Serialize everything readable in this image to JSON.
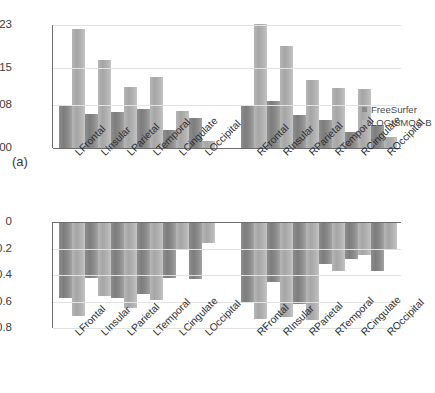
{
  "figure": {
    "panel_a_tag": "(a)",
    "panel_b_tag": "(b)"
  },
  "legend": {
    "freesurfer": "FreeSurfer",
    "logismos": "LOGISMOS-B"
  },
  "colors": {
    "freesurfer": "#8a8a8a",
    "logismos": "#b4b4b4",
    "grid": "#e2e2e2",
    "axis": "#6e6e6e",
    "background": "#ffffff"
  },
  "chart_data": [
    {
      "type": "bar",
      "panel": "(a)",
      "title": "",
      "xlabel": "",
      "ylabel": "",
      "ylim": [
        0.0,
        0.023
      ],
      "yticks": [
        0.0,
        0.008,
        0.015,
        0.023
      ],
      "ytick_labels": [
        "0.000",
        "0.008",
        "0.015",
        "0.023"
      ],
      "grid": true,
      "legend_position": "right",
      "group_gap_after_index": 5,
      "categories": [
        "LFrontal",
        "LInsular",
        "LParietal",
        "LTemporal",
        "LCingulate",
        "LOccipital",
        "RFrontal",
        "RInsular",
        "RParietal",
        "RTemporal",
        "RCingulate",
        "ROccipital"
      ],
      "series": [
        {
          "name": "FreeSurfer",
          "values": [
            0.0079,
            0.0064,
            0.0068,
            0.0072,
            0.0034,
            0.0056,
            0.0081,
            0.0088,
            0.0062,
            0.0053,
            0.0029,
            0.0043
          ]
        },
        {
          "name": "LOGISMOS-B",
          "values": [
            0.0222,
            0.0164,
            0.0115,
            0.0132,
            0.007,
            0.0014,
            0.0232,
            0.019,
            0.0128,
            0.0112,
            0.011,
            0.0021
          ]
        }
      ]
    },
    {
      "type": "bar",
      "panel": "(b)",
      "title": "",
      "xlabel": "",
      "ylabel": "",
      "ylim": [
        -0.8,
        0.0
      ],
      "yticks": [
        0.0,
        -0.2,
        -0.4,
        -0.6,
        -0.8
      ],
      "ytick_labels": [
        "0",
        "−0.2",
        "−0.4",
        "−0.6",
        "−0.8"
      ],
      "grid": true,
      "legend_position": "right",
      "group_gap_after_index": 5,
      "categories": [
        "LFrontal",
        "LInsular",
        "LParietal",
        "LTemporal",
        "LCingulate",
        "LOccipital",
        "RFrontal",
        "RInsular",
        "RParietal",
        "RTemporal",
        "RCingulate",
        "ROccipital"
      ],
      "series": [
        {
          "name": "FreeSurfer",
          "values": [
            -0.57,
            -0.42,
            -0.57,
            -0.54,
            -0.42,
            -0.43,
            -0.6,
            -0.45,
            -0.62,
            -0.32,
            -0.28,
            -0.37
          ]
        },
        {
          "name": "LOGISMOS-B",
          "values": [
            -0.71,
            -0.56,
            -0.65,
            -0.59,
            -0.21,
            -0.16,
            -0.73,
            -0.72,
            -0.74,
            -0.37,
            -0.25,
            -0.21
          ]
        }
      ]
    }
  ]
}
